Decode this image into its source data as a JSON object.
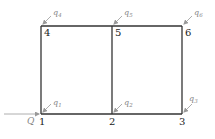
{
  "diagram": {
    "type": "frame-network",
    "colors": {
      "frame": "#333333",
      "arrows": "#999999",
      "labels": "#222222",
      "flow_labels": "#888888"
    },
    "nodes": [
      {
        "id": "1",
        "label": "1",
        "x": 41,
        "y": 114
      },
      {
        "id": "2",
        "label": "2",
        "x": 112,
        "y": 114
      },
      {
        "id": "3",
        "label": "3",
        "x": 182,
        "y": 114
      },
      {
        "id": "4",
        "label": "4",
        "x": 41,
        "y": 26
      },
      {
        "id": "5",
        "label": "5",
        "x": 112,
        "y": 26
      },
      {
        "id": "6",
        "label": "6",
        "x": 182,
        "y": 26
      }
    ],
    "edges": [
      {
        "from": "1",
        "to": "2"
      },
      {
        "from": "2",
        "to": "3"
      },
      {
        "from": "4",
        "to": "5"
      },
      {
        "from": "5",
        "to": "6"
      },
      {
        "from": "1",
        "to": "4"
      },
      {
        "from": "2",
        "to": "5"
      },
      {
        "from": "3",
        "to": "6"
      }
    ],
    "inflow": {
      "label": "Q",
      "node": "1"
    },
    "nodal_flows": [
      {
        "node": "1",
        "base": "q",
        "sub": "1"
      },
      {
        "node": "2",
        "base": "q",
        "sub": "2"
      },
      {
        "node": "3",
        "base": "q",
        "sub": "3"
      },
      {
        "node": "4",
        "base": "q",
        "sub": "4"
      },
      {
        "node": "5",
        "base": "q",
        "sub": "5"
      },
      {
        "node": "6",
        "base": "q",
        "sub": "6"
      }
    ]
  }
}
